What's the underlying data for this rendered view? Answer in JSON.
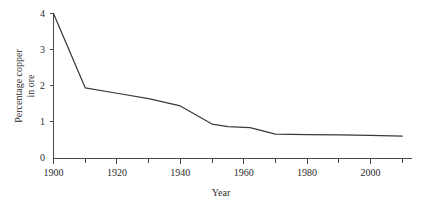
{
  "chart_data": {
    "type": "line",
    "title": "",
    "xlabel": "Year",
    "ylabel": "Percentage copper in ore",
    "ylabel_line1": "Percentage copper",
    "ylabel_line2": "in ore",
    "xlim": [
      1900,
      2011
    ],
    "ylim": [
      0,
      4.15
    ],
    "grid": false,
    "legend": "none",
    "line_color": "#3a3a3a",
    "axis_color": "#4a4a4a",
    "x_ticks_major": [
      1900,
      1920,
      1940,
      1960,
      1980,
      2000
    ],
    "x_tick_labels": [
      "1900",
      "1920",
      "1940",
      "1960",
      "1980",
      "2000"
    ],
    "x_ticks_minor": [
      1910,
      1930,
      1950,
      1970,
      1990,
      2010
    ],
    "y_ticks": [
      0,
      1,
      2,
      3,
      4
    ],
    "y_tick_labels": [
      "0",
      "1",
      "2",
      "3",
      "4"
    ],
    "series": [
      {
        "name": "Percentage copper in ore",
        "x": [
          1900,
          1910,
          1920,
          1930,
          1940,
          1950,
          1955,
          1962,
          1970,
          1980,
          1990,
          2000,
          2010
        ],
        "values": [
          4.0,
          1.95,
          1.8,
          1.65,
          1.45,
          0.95,
          0.88,
          0.85,
          0.67,
          0.66,
          0.65,
          0.64,
          0.62
        ]
      }
    ]
  }
}
